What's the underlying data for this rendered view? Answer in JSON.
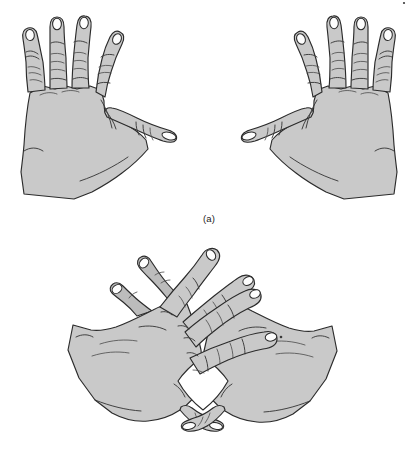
{
  "figure": {
    "background_color": "#ffffff",
    "width": 418,
    "height": 475,
    "skin_fill_color": "#c9c9c9",
    "skin_shaded_color": "#bcbcbc",
    "outline_color": "#2b2b2b",
    "nail_color": "#fdfdfd",
    "caption_color": "#1c1c1c"
  },
  "panels": [
    {
      "id": "a",
      "caption": "(a)",
      "description": "Two open hands shown palm-forward side by side, fingers spread, thumbs pointing inward toward each other",
      "hand_count": 2,
      "hands": [
        {
          "side": "left",
          "pose": "open-palm-spread",
          "finger_count": 4,
          "thumb_direction": "right",
          "visible_nails": 5
        },
        {
          "side": "right",
          "pose": "open-palm-spread",
          "finger_count": 4,
          "thumb_direction": "left",
          "visible_nails": 5
        }
      ]
    },
    {
      "id": "b",
      "caption": "(b)",
      "description": "The same two hands with fingers interlocked and thumbs crossed below, forming a diamond-shaped opening between the palms",
      "hand_count": 2,
      "interlocked": true,
      "opening_shape": "diamond",
      "hands": [
        {
          "side": "left",
          "pose": "interlocked",
          "finger_count": 4,
          "thumb_direction": "crossed-under"
        },
        {
          "side": "right",
          "pose": "interlocked",
          "finger_count": 4,
          "thumb_direction": "crossed-under"
        }
      ]
    }
  ]
}
